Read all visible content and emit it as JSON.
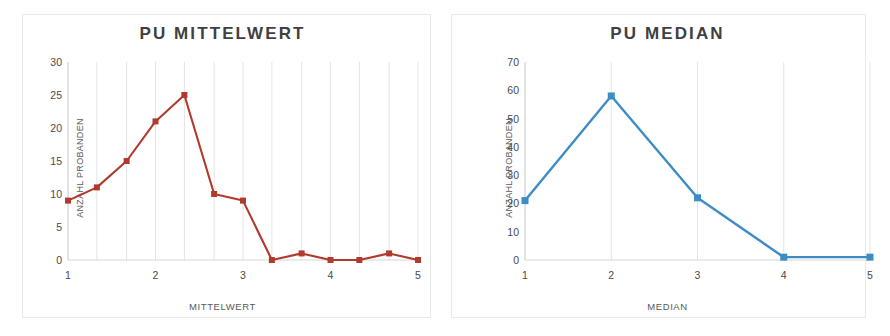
{
  "chart_data": [
    {
      "type": "line",
      "title": "PU MITTELWERT",
      "xlabel": "MITTELWERT",
      "ylabel": "ANZAHL PROBANDEN",
      "series_color": "#B03A2E",
      "marker": "square",
      "grid": "vertical",
      "legend": "none",
      "xlim": [
        1,
        5
      ],
      "ylim": [
        0,
        30
      ],
      "xticks": [
        "1",
        "2",
        "3",
        "4",
        "5"
      ],
      "xtick_values": [
        1,
        2,
        3,
        4,
        5
      ],
      "yticks": [
        "0",
        "5",
        "10",
        "15",
        "20",
        "25",
        "30"
      ],
      "ytick_values": [
        0,
        5,
        10,
        15,
        20,
        25,
        30
      ],
      "x": [
        1.0,
        1.33,
        1.67,
        2.0,
        2.33,
        2.67,
        3.0,
        3.33,
        3.67,
        4.0,
        4.33,
        4.67,
        5.0
      ],
      "values": [
        9,
        11,
        15,
        21,
        25,
        10,
        9,
        0,
        1,
        0,
        0,
        1,
        0
      ]
    },
    {
      "type": "line",
      "title": "PU MEDIAN",
      "xlabel": "MEDIAN",
      "ylabel": "ANZAHL PROBANDEN",
      "series_color": "#3D8DC4",
      "marker": "square",
      "grid": "vertical",
      "legend": "none",
      "xlim": [
        1,
        5
      ],
      "ylim": [
        0,
        70
      ],
      "xticks": [
        "1",
        "2",
        "3",
        "4",
        "5"
      ],
      "xtick_values": [
        1,
        2,
        3,
        4,
        5
      ],
      "yticks": [
        "0",
        "10",
        "20",
        "30",
        "40",
        "50",
        "60",
        "70"
      ],
      "ytick_values": [
        0,
        10,
        20,
        30,
        40,
        50,
        60,
        70
      ],
      "x": [
        1,
        2,
        3,
        4,
        5
      ],
      "values": [
        21,
        58,
        22,
        1,
        1
      ]
    }
  ]
}
